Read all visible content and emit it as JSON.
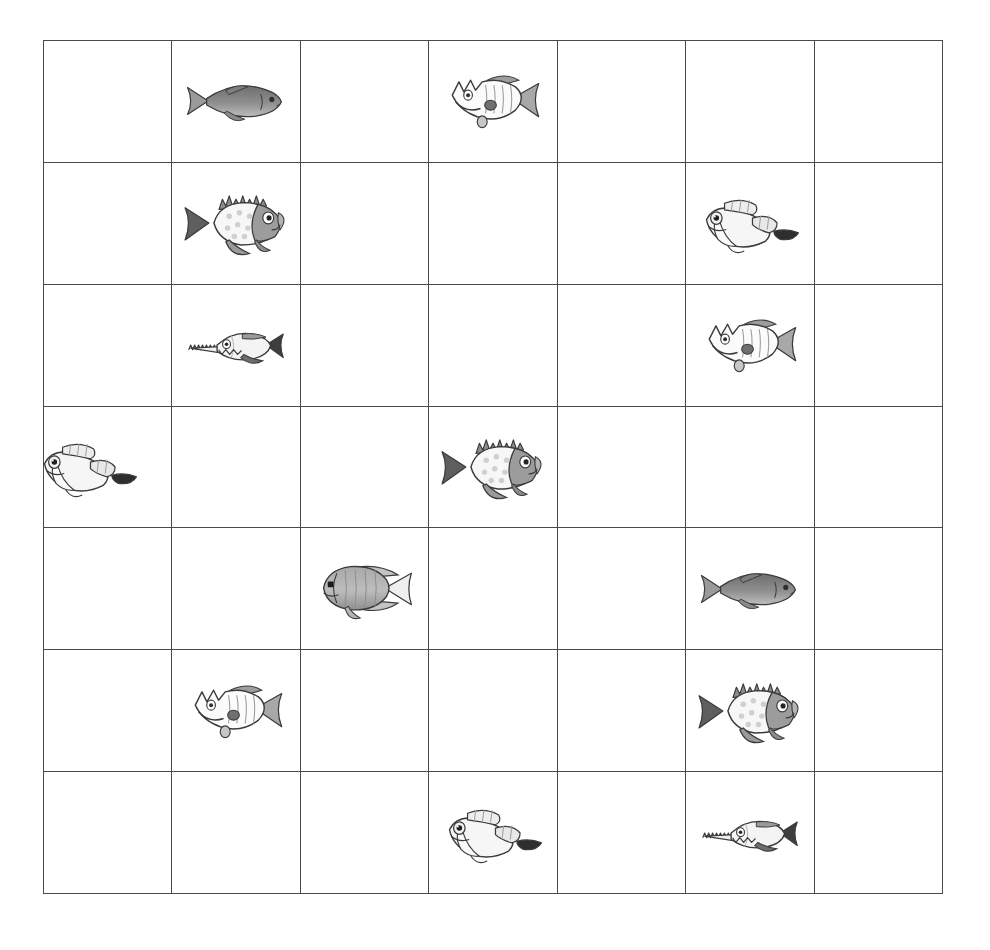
{
  "worksheet": {
    "title": "Fish Grid Worksheet",
    "description": "A hand-drawn 7 by 7 grid containing scattered pencil sketches of fish.",
    "background_color": "#ffffff",
    "grid": {
      "rows": 7,
      "columns": 7,
      "line_color": "#4a4a4a",
      "line_width_px": 1.6,
      "left_px": 43,
      "top_px": 40,
      "width_px": 900,
      "height_px": 854,
      "cell_width_px": 128.6,
      "cell_height_px": 122.0
    },
    "species_legend": [
      {
        "key": "trout",
        "label": "shaded trout",
        "facing": "right",
        "notes": "solid grey body, forked tail at left"
      },
      {
        "key": "spiky",
        "label": "spiky-head striped fish",
        "facing": "left",
        "notes": "jagged head crest, vertical stripes, fan tail at right"
      },
      {
        "key": "sunfish",
        "label": "spotted sunfish",
        "facing": "right",
        "notes": "spiky dorsal fin, polka-dot body, dark forked tail"
      },
      {
        "key": "needle",
        "label": "needle-nose fish",
        "facing": "right",
        "notes": "serrated snout, toothy grin, dark forked tail"
      },
      {
        "key": "winged",
        "label": "winged tadpole fish",
        "facing": "left",
        "notes": "big eye, wing-like fins, dark thin tail at right"
      },
      {
        "key": "angel",
        "label": "angelfish",
        "facing": "left",
        "notes": "tall oval body, triangular tail at right"
      }
    ],
    "fish_count": 14,
    "empty_columns": [
      5,
      7
    ],
    "placements": [
      {
        "row": 1,
        "col": 2,
        "species": "trout"
      },
      {
        "row": 1,
        "col": 4,
        "species": "spiky"
      },
      {
        "row": 2,
        "col": 2,
        "species": "sunfish"
      },
      {
        "row": 2,
        "col": 6,
        "species": "winged"
      },
      {
        "row": 3,
        "col": 2,
        "species": "needle"
      },
      {
        "row": 3,
        "col": 6,
        "species": "spiky"
      },
      {
        "row": 4,
        "col": 1,
        "species": "winged"
      },
      {
        "row": 4,
        "col": 4,
        "species": "sunfish"
      },
      {
        "row": 5,
        "col": 3,
        "species": "angel"
      },
      {
        "row": 5,
        "col": 6,
        "species": "trout"
      },
      {
        "row": 6,
        "col": 2,
        "species": "spiky"
      },
      {
        "row": 6,
        "col": 6,
        "species": "sunfish"
      },
      {
        "row": 7,
        "col": 4,
        "species": "winged"
      },
      {
        "row": 7,
        "col": 6,
        "species": "needle"
      }
    ]
  }
}
